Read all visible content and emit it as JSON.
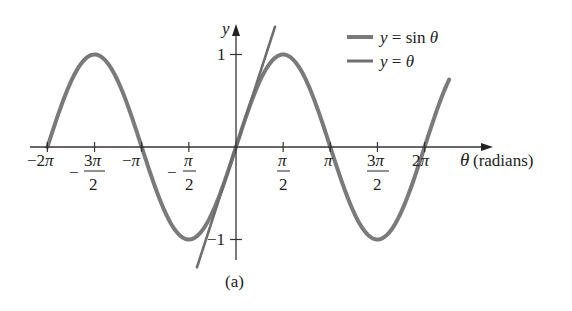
{
  "chart_data": {
    "type": "line",
    "title": "",
    "caption": "(a)",
    "xlabel": "θ (radians)",
    "xlabel_symbol": "θ",
    "xlabel_unit": "(radians)",
    "ylabel": "y",
    "xlim": [
      -6.283,
      7.1
    ],
    "ylim": [
      -1.2,
      1.3
    ],
    "grid": false,
    "legend_position": "upper right",
    "x_ticks": [
      {
        "value": -6.2832,
        "label": "−2π"
      },
      {
        "value": -4.7124,
        "label": "−3π/2"
      },
      {
        "value": -3.1416,
        "label": "−π"
      },
      {
        "value": -1.5708,
        "label": "−π/2"
      },
      {
        "value": 1.5708,
        "label": "π/2"
      },
      {
        "value": 3.1416,
        "label": "π"
      },
      {
        "value": 4.7124,
        "label": "3π/2"
      },
      {
        "value": 6.2832,
        "label": "2π"
      }
    ],
    "y_ticks": [
      {
        "value": 1,
        "label": "1"
      },
      {
        "value": -1,
        "label": "−1"
      }
    ],
    "series": [
      {
        "name": "y = sin θ",
        "function": "sin",
        "domain": [
          -6.2832,
          7.1
        ],
        "color": "#7a7a7a",
        "x": [
          -6.2832,
          -4.7124,
          -3.1416,
          -1.5708,
          0,
          1.5708,
          3.1416,
          4.7124,
          6.2832,
          7.1
        ],
        "values": [
          0,
          1,
          0,
          -1,
          0,
          1,
          0,
          -1,
          0,
          0.73
        ]
      },
      {
        "name": "y = θ",
        "function": "identity",
        "domain": [
          -1.3,
          1.3
        ],
        "color": "#6e6e6e",
        "x": [
          -1.3,
          0,
          1.3
        ],
        "values": [
          -1.3,
          0,
          1.3
        ]
      }
    ]
  },
  "legend": {
    "items": [
      {
        "label": "y = sin θ"
      },
      {
        "label": "y = θ"
      }
    ]
  },
  "axis": {
    "y_label": "y",
    "x_label_symbol": "θ",
    "x_label_unit": "(radians)",
    "y_tick_pos": "1",
    "y_tick_neg": "−1"
  },
  "caption": "(a)"
}
